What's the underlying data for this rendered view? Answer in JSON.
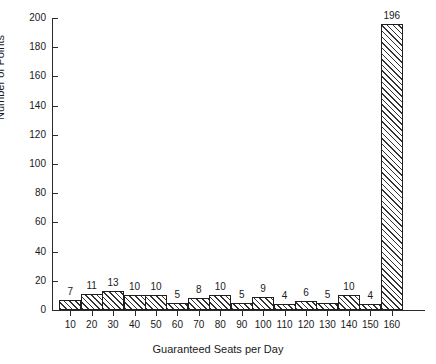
{
  "chart_data": {
    "type": "bar",
    "title": "",
    "xlabel": "Guaranteed Seats per Day",
    "ylabel": "Number of Points",
    "categories": [
      "10",
      "20",
      "30",
      "40",
      "50",
      "60",
      "70",
      "80",
      "90",
      "100",
      "110",
      "120",
      "130",
      "140",
      "150",
      "160"
    ],
    "values": [
      7,
      11,
      13,
      10,
      10,
      5,
      8,
      10,
      5,
      9,
      4,
      6,
      5,
      10,
      4,
      196
    ],
    "value_labels": [
      "7",
      "11",
      "13",
      "10",
      "10",
      "5",
      "8",
      "10",
      "5",
      "9",
      "4",
      "6",
      "5",
      "10",
      "4",
      "196"
    ],
    "ylim": [
      0,
      200
    ],
    "yticks": [
      0,
      20,
      40,
      60,
      80,
      100,
      120,
      140,
      160,
      180,
      200
    ],
    "ytick_labels": [
      "0",
      "20",
      "40",
      "60",
      "80",
      "100",
      "120",
      "140",
      "160",
      "180",
      "200"
    ],
    "grid": false,
    "legend": "none",
    "bar_fill": "hatched-diagonal",
    "line_color": "#1f1f1f",
    "background": "#ffffff"
  }
}
